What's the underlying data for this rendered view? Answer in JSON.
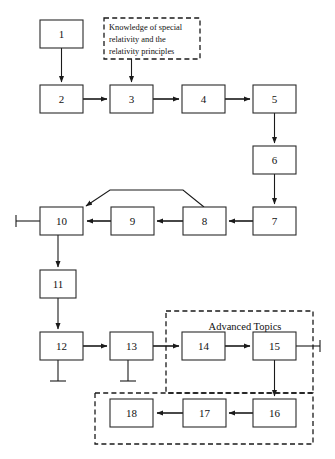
{
  "diagram": {
    "type": "flowchart",
    "title": "",
    "background_color": "#ffffff",
    "line_color": "#1a1a1a",
    "box_fill": "#ffffff",
    "nodes": [
      {
        "id": "n1",
        "label": "1",
        "x": 40,
        "y": 20,
        "w": 43,
        "h": 28
      },
      {
        "id": "n2",
        "label": "2",
        "x": 40,
        "y": 85,
        "w": 43,
        "h": 28
      },
      {
        "id": "n3",
        "label": "3",
        "x": 110,
        "y": 85,
        "w": 43,
        "h": 28
      },
      {
        "id": "n4",
        "label": "4",
        "x": 182,
        "y": 85,
        "w": 43,
        "h": 28
      },
      {
        "id": "n5",
        "label": "5",
        "x": 253,
        "y": 85,
        "w": 43,
        "h": 28
      },
      {
        "id": "n6",
        "label": "6",
        "x": 253,
        "y": 146,
        "w": 43,
        "h": 28
      },
      {
        "id": "n7",
        "label": "7",
        "x": 253,
        "y": 207,
        "w": 43,
        "h": 28
      },
      {
        "id": "n8",
        "label": "8",
        "x": 183,
        "y": 207,
        "w": 43,
        "h": 28
      },
      {
        "id": "n9",
        "label": "9",
        "x": 111,
        "y": 207,
        "w": 43,
        "h": 28
      },
      {
        "id": "n10",
        "label": "10",
        "x": 40,
        "y": 207,
        "w": 43,
        "h": 28
      },
      {
        "id": "n11",
        "label": "11",
        "x": 40,
        "y": 270,
        "w": 36,
        "h": 28
      },
      {
        "id": "n12",
        "label": "12",
        "x": 40,
        "y": 332,
        "w": 43,
        "h": 28
      },
      {
        "id": "n13",
        "label": "13",
        "x": 110,
        "y": 332,
        "w": 43,
        "h": 28
      },
      {
        "id": "n14",
        "label": "14",
        "x": 182,
        "y": 332,
        "w": 43,
        "h": 28
      },
      {
        "id": "n15",
        "label": "15",
        "x": 253,
        "y": 332,
        "w": 43,
        "h": 28
      },
      {
        "id": "n16",
        "label": "16",
        "x": 253,
        "y": 399,
        "w": 43,
        "h": 28
      },
      {
        "id": "n17",
        "label": "17",
        "x": 183,
        "y": 399,
        "w": 43,
        "h": 28
      },
      {
        "id": "n18",
        "label": "18",
        "x": 110,
        "y": 399,
        "w": 43,
        "h": 28
      }
    ],
    "note": {
      "id": "note-knowledge",
      "x": 104,
      "y": 18,
      "w": 96,
      "h": 41,
      "lines": [
        "Knowledge of special",
        "relativity and the",
        "relativity principles"
      ]
    },
    "groups": [
      {
        "id": "group-advanced-topics",
        "label": "Advanced Topics",
        "x": 166,
        "y": 311,
        "w": 147,
        "h": 82,
        "label_x": 245,
        "label_y": 327
      },
      {
        "id": "group-lower",
        "label": "",
        "x": 95,
        "y": 393,
        "w": 218,
        "h": 51,
        "label_x": 0,
        "label_y": 0
      }
    ],
    "edges": [
      {
        "id": "e1-2",
        "from": "1",
        "to": "2",
        "kind": "arrow-down"
      },
      {
        "id": "enote-3",
        "from": "note",
        "to": "3",
        "kind": "arrow-down"
      },
      {
        "id": "e2-3",
        "from": "2",
        "to": "3",
        "kind": "arrow-right"
      },
      {
        "id": "e3-4",
        "from": "3",
        "to": "4",
        "kind": "arrow-right"
      },
      {
        "id": "e4-5",
        "from": "4",
        "to": "5",
        "kind": "arrow-right"
      },
      {
        "id": "e5-6",
        "from": "5",
        "to": "6",
        "kind": "arrow-down"
      },
      {
        "id": "e6-7",
        "from": "6",
        "to": "7",
        "kind": "arrow-down"
      },
      {
        "id": "e7-8",
        "from": "7",
        "to": "8",
        "kind": "arrow-left"
      },
      {
        "id": "e8-9",
        "from": "8",
        "to": "9",
        "kind": "arrow-left"
      },
      {
        "id": "e9-10",
        "from": "9",
        "to": "10",
        "kind": "arrow-left"
      },
      {
        "id": "e8-10",
        "from": "8",
        "to": "10",
        "kind": "arrow-bypass-top"
      },
      {
        "id": "e10-11",
        "from": "10",
        "to": "11",
        "kind": "arrow-down"
      },
      {
        "id": "e11-12",
        "from": "11",
        "to": "12",
        "kind": "arrow-down"
      },
      {
        "id": "e12-13",
        "from": "12",
        "to": "13",
        "kind": "arrow-right"
      },
      {
        "id": "e13-14",
        "from": "13",
        "to": "14",
        "kind": "arrow-right"
      },
      {
        "id": "e14-15",
        "from": "14",
        "to": "15",
        "kind": "arrow-right"
      },
      {
        "id": "e15-16",
        "from": "15",
        "to": "16",
        "kind": "arrow-down"
      },
      {
        "id": "e16-17",
        "from": "16",
        "to": "17",
        "kind": "arrow-left"
      },
      {
        "id": "e17-18",
        "from": "17",
        "to": "18",
        "kind": "arrow-left"
      }
    ],
    "terminators": [
      {
        "id": "t-10-left",
        "node": "10",
        "side": "left"
      },
      {
        "id": "t-12-down",
        "node": "12",
        "side": "down"
      },
      {
        "id": "t-13-down",
        "node": "13",
        "side": "down"
      },
      {
        "id": "t-15-right",
        "node": "15",
        "side": "right"
      }
    ]
  }
}
